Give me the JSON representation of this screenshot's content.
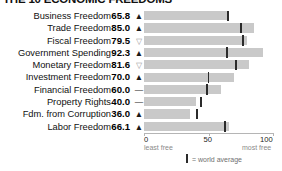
{
  "title": "THE 10 ECONOMIC FREEDOMS",
  "axis": {
    "min": 0,
    "max": 100,
    "ticks": [
      {
        "value": 0,
        "label": "0",
        "sub": "least free"
      },
      {
        "value": 50,
        "label": "50",
        "sub": ""
      },
      {
        "value": 100,
        "label": "100",
        "sub": "most free"
      }
    ]
  },
  "legend": {
    "marker_icon": "vertical-tick-icon",
    "text": "= world average"
  },
  "colors": {
    "bar": "#c9c9c9",
    "average_tick": "#2b2b2b",
    "axis": "#b5b5b5",
    "text": "#111111",
    "muted_text": "#8a8a8a"
  },
  "trend_glyphs": {
    "up": "▲",
    "down": "▽",
    "flat": "—"
  },
  "chart_data": {
    "type": "bar",
    "orientation": "horizontal",
    "title": "THE 10 ECONOMIC FREEDOMS",
    "xlabel": "",
    "ylabel": "",
    "xlim": [
      0,
      100
    ],
    "grid": false,
    "legend_position": "bottom",
    "categories": [
      "Business Freedom",
      "Trade Freedom",
      "Fiscal Freedom",
      "Government Spending",
      "Monetary Freedom",
      "Investment Freedom",
      "Financial Freedom",
      "Property Rights",
      "Fdm. from Corruption",
      "Labor Freedom"
    ],
    "values": [
      65.8,
      85.0,
      79.5,
      92.3,
      81.6,
      70.0,
      60.0,
      40.0,
      36.0,
      66.1
    ],
    "value_labels": [
      "65.8",
      "85.0",
      "79.5",
      "92.3",
      "81.6",
      "70.0",
      "60.0",
      "40.0",
      "36.0",
      "66.1"
    ],
    "trends": [
      "up",
      "up",
      "down",
      "up",
      "down",
      "up",
      "flat",
      "flat",
      "up",
      "up"
    ],
    "world_average": [
      65.0,
      75.0,
      76.5,
      64.5,
      71.5,
      50.0,
      49.0,
      44.0,
      41.0,
      62.5
    ],
    "series": [
      {
        "name": "Score",
        "values": [
          65.8,
          85.0,
          79.5,
          92.3,
          81.6,
          70.0,
          60.0,
          40.0,
          36.0,
          66.1
        ]
      },
      {
        "name": "world average",
        "values": [
          65.0,
          75.0,
          76.5,
          64.5,
          71.5,
          50.0,
          49.0,
          44.0,
          41.0,
          62.5
        ]
      }
    ]
  },
  "rows": [
    {
      "label": "Business Freedom",
      "score": "65.8",
      "trend": "up",
      "value": 65.8,
      "avg": 65.0
    },
    {
      "label": "Trade Freedom",
      "score": "85.0",
      "trend": "up",
      "value": 85.0,
      "avg": 75.0
    },
    {
      "label": "Fiscal Freedom",
      "score": "79.5",
      "trend": "down",
      "value": 79.5,
      "avg": 76.5
    },
    {
      "label": "Government Spending",
      "score": "92.3",
      "trend": "up",
      "value": 92.3,
      "avg": 64.5
    },
    {
      "label": "Monetary Freedom",
      "score": "81.6",
      "trend": "down",
      "value": 81.6,
      "avg": 71.5
    },
    {
      "label": "Investment Freedom",
      "score": "70.0",
      "trend": "up",
      "value": 70.0,
      "avg": 50.0
    },
    {
      "label": "Financial Freedom",
      "score": "60.0",
      "trend": "flat",
      "value": 60.0,
      "avg": 49.0
    },
    {
      "label": "Property Rights",
      "score": "40.0",
      "trend": "flat",
      "value": 40.0,
      "avg": 44.0
    },
    {
      "label": "Fdm. from Corruption",
      "score": "36.0",
      "trend": "up",
      "value": 36.0,
      "avg": 41.0
    },
    {
      "label": "Labor Freedom",
      "score": "66.1",
      "trend": "up",
      "value": 66.1,
      "avg": 62.5
    }
  ]
}
